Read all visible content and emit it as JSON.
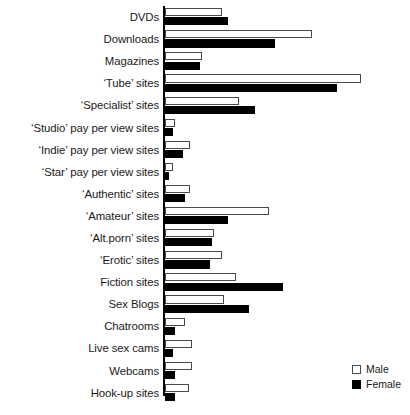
{
  "chart_data": {
    "type": "bar",
    "orientation": "horizontal",
    "title": "",
    "xlabel": "",
    "ylabel": "",
    "grid": false,
    "legend_position": "bottom-right",
    "xlim": [
      0,
      100
    ],
    "categories": [
      "DVDs",
      "Downloads",
      "Magazines",
      "‘Tube’ sites",
      "‘Specialist’ sites",
      "‘Studio’ pay per view sites",
      "‘Indie’ pay per view sites",
      "‘Star’ pay per view sites",
      "‘Authentic’ sites",
      "‘Amateur’ sites",
      "‘Alt.porn’ sites",
      "‘Erotic’ sites",
      "Fiction sites",
      "Sex Blogs",
      "Chatrooms",
      "Live sex cams",
      "Webcams",
      "Hook-up sites"
    ],
    "series": [
      {
        "name": "Male",
        "color": "#ffffff",
        "values": [
          29,
          75,
          19,
          100,
          38,
          5,
          13,
          4,
          13,
          53,
          25,
          29,
          36,
          30,
          10,
          14,
          14,
          12
        ]
      },
      {
        "name": "Female",
        "color": "#000000",
        "values": [
          32,
          56,
          18,
          88,
          46,
          4,
          9,
          2,
          10,
          32,
          24,
          23,
          60,
          43,
          5,
          4,
          5,
          5
        ]
      }
    ]
  },
  "legend": {
    "items": [
      {
        "label": "Male",
        "swatch": "open-square-swatch"
      },
      {
        "label": "Female",
        "swatch": "filled-square-swatch"
      }
    ]
  },
  "caption": {
    "text": ""
  }
}
